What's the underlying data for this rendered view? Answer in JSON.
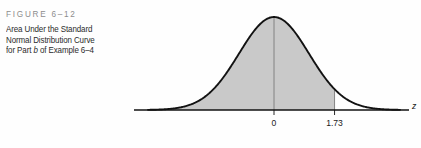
{
  "figure": {
    "number_label": "FIGURE 6–12",
    "caption_line_1": "Area Under the Standard",
    "caption_line_2": "Normal Distribution Curve",
    "caption_line_3_pre": "for Part ",
    "caption_line_3_italic": "b",
    "caption_line_3_post": " of Example 6–4"
  },
  "colors": {
    "curve_stroke": "#121212",
    "axis_stroke": "#121212",
    "shade_fill": "#c9c9c9",
    "marker_line": "#7a7a7a",
    "figure_number_text": "#8d8d8d",
    "caption_text": "#2b2b2b",
    "background": "#fefefe"
  },
  "chart_data": {
    "type": "area",
    "title": "Area Under the Standard Normal Distribution Curve",
    "distribution": "standard normal",
    "mean": 0,
    "std_dev": 1,
    "xlabel": "z",
    "ylabel": "",
    "grid": false,
    "legend": false,
    "xlim": [
      -3.6,
      3.6
    ],
    "ylim": [
      0,
      0.42
    ],
    "tick_labels": [
      "0",
      "1.73"
    ],
    "tick_values": [
      0,
      1.73
    ],
    "shaded_region": {
      "from": "-infinity",
      "to": 1.73,
      "label": "",
      "fill": "#c9c9c9"
    },
    "markers": [
      {
        "label": "0",
        "z": 0,
        "line_from_curve_to_axis": true
      },
      {
        "label": "1.73",
        "z": 1.73,
        "line_from_curve_to_axis": true
      }
    ],
    "x": [
      -3.6,
      -3.2,
      -2.8,
      -2.4,
      -2.0,
      -1.6,
      -1.2,
      -0.8,
      -0.4,
      0.0,
      0.4,
      0.8,
      1.2,
      1.6,
      1.73,
      2.0,
      2.4,
      2.8,
      3.2,
      3.6
    ],
    "y": [
      0.0006,
      0.0024,
      0.0079,
      0.0224,
      0.054,
      0.1109,
      0.1942,
      0.2897,
      0.3683,
      0.3989,
      0.3683,
      0.2897,
      0.1942,
      0.1109,
      0.0893,
      0.054,
      0.0224,
      0.0079,
      0.0024,
      0.0006
    ]
  }
}
